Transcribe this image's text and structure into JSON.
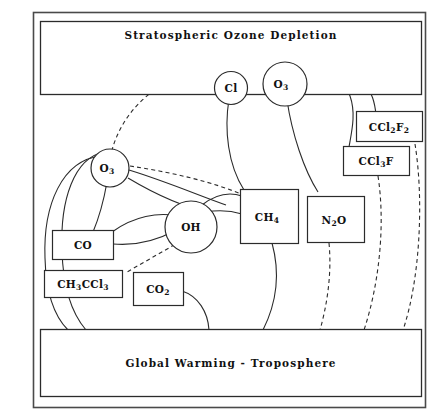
{
  "figure": {
    "name": "stratospheric-ozone-troposphere-interaction-diagram",
    "background": "#ffffff",
    "line_color": "#2b2b2b",
    "frame_color": "#4a4a4a"
  },
  "bands": {
    "top": {
      "label": "Stratospheric  Ozone  Depletion",
      "name": "stratospheric-ozone-depletion-band"
    },
    "bottom": {
      "label": "Global Warming  -  Troposphere",
      "name": "global-warming-troposphere-band"
    }
  },
  "nodes": [
    {
      "id": "cl_strat",
      "kind": "circle",
      "label": "Cl",
      "sub": "",
      "tail": ""
    },
    {
      "id": "o3_strat",
      "kind": "circle",
      "label": "O",
      "sub": "3",
      "tail": ""
    },
    {
      "id": "o3_trop",
      "kind": "circle",
      "label": "O",
      "sub": "3",
      "tail": ""
    },
    {
      "id": "oh",
      "kind": "circle",
      "label": "OH",
      "sub": "",
      "tail": ""
    },
    {
      "id": "ccl2f2",
      "kind": "box",
      "label": "CCl",
      "sub": "2",
      "tail": "F",
      "tail_sub": "2"
    },
    {
      "id": "ccl3f",
      "kind": "box",
      "label": "CCl",
      "sub": "3",
      "tail": "F"
    },
    {
      "id": "ch4",
      "kind": "box",
      "label": "CH",
      "sub": "4",
      "tail": ""
    },
    {
      "id": "n2o",
      "kind": "box",
      "label": "N",
      "sub": "2",
      "tail": "O"
    },
    {
      "id": "co",
      "kind": "box",
      "label": "CO",
      "sub": "",
      "tail": ""
    },
    {
      "id": "ch3ccl3",
      "kind": "box",
      "label": "CH",
      "sub": "3",
      "tail": "CCl",
      "tail_sub": "3"
    },
    {
      "id": "co2",
      "kind": "box",
      "label": "CO",
      "sub": "2",
      "tail": ""
    }
  ],
  "node_labels": {
    "cl_strat": "Cl",
    "o3_strat": "O3",
    "o3_trop": "O3",
    "oh": "OH",
    "ccl2f2": "CCl2F2",
    "ccl3f": "CCl3F",
    "ch4": "CH4",
    "n2o": "N2O",
    "co": "CO",
    "ch3ccl3": "CH3CCl3",
    "co2": "CO2"
  },
  "edges": [
    {
      "from": "cl_strat",
      "to": "o3_strat",
      "style": "solid"
    },
    {
      "from": "cl_strat",
      "to": "ccl2f2",
      "style": "solid"
    },
    {
      "from": "cl_strat",
      "to": "ccl3f",
      "style": "solid"
    },
    {
      "from": "cl_strat",
      "to": "ch4",
      "style": "solid"
    },
    {
      "from": "o3_strat",
      "to": "n2o",
      "style": "solid"
    },
    {
      "from": "o3_trop",
      "to": "cl_strat",
      "style": "dashed"
    },
    {
      "from": "o3_trop",
      "to": "oh",
      "style": "dashed"
    },
    {
      "from": "o3_trop",
      "to": "co",
      "style": "solid"
    },
    {
      "from": "o3_trop",
      "to": "oh",
      "style": "solid"
    },
    {
      "from": "o3_trop",
      "to": "bottom_band",
      "style": "solid"
    },
    {
      "from": "oh",
      "to": "co",
      "style": "solid"
    },
    {
      "from": "oh",
      "to": "ch4",
      "style": "solid"
    },
    {
      "from": "oh",
      "to": "ch3ccl3",
      "style": "dashed"
    },
    {
      "from": "ch4",
      "to": "bottom_band",
      "style": "solid"
    },
    {
      "from": "co2",
      "to": "bottom_band",
      "style": "solid"
    },
    {
      "from": "n2o",
      "to": "bottom_band",
      "style": "dashed"
    },
    {
      "from": "ccl3f",
      "to": "bottom_band",
      "style": "dashed"
    },
    {
      "from": "ccl2f2",
      "to": "bottom_band",
      "style": "dashed"
    }
  ]
}
